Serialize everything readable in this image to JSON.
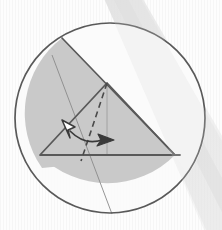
{
  "canvas": {
    "width": 222,
    "height": 230,
    "background_color": "#fdfdfd",
    "texture": "faint-vertical-scanlines",
    "watermark_band": {
      "description": "diagonal pale gray band sweeping from top-center to bottom-right",
      "color": "#e2e2e2"
    }
  },
  "figure": {
    "kind": "geometry-diagram"
  },
  "colors": {
    "outline": "#595959",
    "shade_fill": "#c9c9c9",
    "thin_line": "#8a8a8a",
    "dash_line": "#4a4a4a",
    "arrow_dark": "#3a3a3a",
    "arrow_hollow_fill": "#ffffff",
    "white_region": "#fbfbfb"
  },
  "circle": {
    "label": "outer-circle",
    "cx": 110,
    "cy": 118,
    "r": 95,
    "stroke": "#595959",
    "stroke_width": 1.7,
    "fill": "#fbfbfb"
  },
  "shaded_region": {
    "label": "shaded-segment-and-triangle",
    "fill": "#c9c9c9",
    "description": "large gray region bounded by the upper-left chord, the triangle hypotenuse and the lower circular arc"
  },
  "triangle": {
    "label": "main-triangle",
    "vertices": [
      {
        "name": "left-vertex",
        "x": 40,
        "y": 155
      },
      {
        "name": "apex-vertex",
        "x": 107,
        "y": 83
      },
      {
        "name": "right-vertex",
        "x": 175,
        "y": 155
      }
    ],
    "stroke": "#595959",
    "stroke_width": 1.8
  },
  "chord": {
    "label": "upper-left-chord",
    "x1": 62,
    "y1": 38,
    "x2": 175,
    "y2": 155,
    "stroke": "#595959",
    "stroke_width": 1.7
  },
  "thin_line": {
    "label": "thin-cevian-line",
    "x1": 52,
    "y1": 55,
    "x2": 112,
    "y2": 214,
    "stroke": "#8a8a8a",
    "stroke_width": 0.9
  },
  "altitude_line": {
    "label": "vertical-altitude",
    "x1": 107,
    "y1": 83,
    "x2": 107,
    "y2": 156,
    "stroke": "#9a9a9a",
    "stroke_width": 0.9
  },
  "dashed_line": {
    "label": "dashed-rotated-ray",
    "x1": 107,
    "y1": 83,
    "x2": 81,
    "y2": 160,
    "stroke": "#4a4a4a",
    "stroke_width": 1.6,
    "dash_pattern": "6 4"
  },
  "angle_arrow": {
    "label": "double-headed-rotation-arrow",
    "arc_path": "M 69 130 Q 85 146 104 139",
    "stroke": "#3a3a3a",
    "stroke_width": 1.7,
    "heads": [
      {
        "name": "hollow-arrowhead",
        "direction": "up-left",
        "tip_x": 63,
        "tip_y": 121,
        "style": "outlined-white"
      },
      {
        "name": "solid-arrowhead",
        "direction": "right",
        "tip_x": 112,
        "tip_y": 140,
        "style": "filled-dark"
      }
    ]
  },
  "labels": []
}
